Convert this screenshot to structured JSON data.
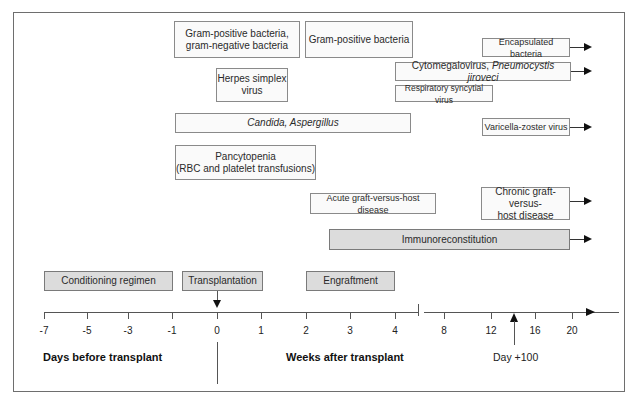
{
  "diagram": {
    "title": "",
    "boxes": {
      "gram_pos_neg": {
        "line1": "Gram-positive bacteria,",
        "line2": "gram-negative bacteria"
      },
      "gram_pos": {
        "label": "Gram-positive bacteria"
      },
      "encapsulated": {
        "label": "Encapsulated bacteria"
      },
      "herpes": {
        "line1": "Herpes simplex",
        "line2": "virus"
      },
      "cmv": {
        "label_plain": "Cytomegalovirus, ",
        "label_italic": "Pneumocystis jiroveci"
      },
      "rsv": {
        "label": "Respiratory syncytial virus"
      },
      "candida": {
        "label": "Candida, Aspergillus"
      },
      "vzv": {
        "label": "Varicella-zoster virus"
      },
      "pancytopenia": {
        "line1": "Pancytopenia",
        "line2": "(RBC and platelet transfusions)"
      },
      "acute_gvhd": {
        "label": "Acute graft-versus-host disease"
      },
      "chronic_gvhd": {
        "line1": "Chronic graft-versus-",
        "line2": "host disease"
      },
      "immuno": {
        "label": "Immunoreconstitution"
      },
      "conditioning": {
        "label": "Conditioning regimen"
      },
      "transplantation": {
        "label": "Transplantation"
      },
      "engraftment": {
        "label": "Engraftment"
      }
    },
    "axis": {
      "days_ticks": [
        "-7",
        "-5",
        "-3",
        "-1",
        "0"
      ],
      "weeks_ticks_early": [
        "1",
        "2",
        "3",
        "4"
      ],
      "weeks_ticks_late": [
        "8",
        "12",
        "16",
        "20"
      ],
      "days_title": "Days before transplant",
      "weeks_title": "Weeks after transplant",
      "day100_label": "Day +100"
    },
    "colors": {
      "box_fill": "#fafafa",
      "shaded_fill": "#dcdcdc",
      "border": "#8a8a8a",
      "frame": "#6e6e6e"
    }
  }
}
